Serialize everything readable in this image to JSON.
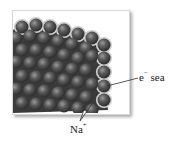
{
  "diagram": {
    "labels": {
      "electron_sea": {
        "base": "e",
        "superscript": "−",
        "text": "sea"
      },
      "cation": {
        "base": "Na",
        "superscript": "+"
      }
    },
    "colors": {
      "sphere": "#4a4a4a",
      "sphere_highlight": "#8a8a8a",
      "electron_sea_halo": "#c8c8c8",
      "leader_line": "#333333"
    }
  }
}
